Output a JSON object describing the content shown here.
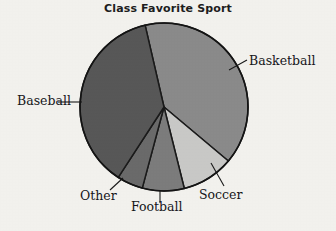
{
  "chart_data": {
    "type": "pie",
    "title": "Class Favorite Sport",
    "subtitle": "",
    "xlabel": "",
    "ylabel": "",
    "legend_position": "none",
    "labels_position": "outside-with-leader-lines",
    "grid": false,
    "categories": [
      "Basketball",
      "Soccer",
      "Football",
      "Other",
      "Baseball"
    ],
    "values": [
      39.7,
      10.0,
      8.1,
      5.0,
      37.2
    ],
    "units": "percent",
    "slices": [
      {
        "name": "Basketball",
        "label": "Basketball",
        "value": 39.7,
        "color": "#8b8b8b",
        "start_angle_deg": 347,
        "end_angle_deg": 130,
        "leader_from": [
          229,
          70
        ],
        "leader_to": [
          247,
          60
        ],
        "label_anchor": "start"
      },
      {
        "name": "Soccer",
        "label": "Soccer",
        "value": 10.0,
        "color": "#cacac8",
        "start_angle_deg": 130,
        "end_angle_deg": 166,
        "leader_from": [
          211,
          163
        ],
        "leader_to": [
          224,
          186
        ],
        "label_anchor": "middle"
      },
      {
        "name": "Football",
        "label": "Football",
        "value": 8.1,
        "color": "#7d7d7d",
        "start_angle_deg": 166,
        "end_angle_deg": 195,
        "leader_from": [
          160,
          190
        ],
        "leader_to": [
          160,
          203
        ],
        "label_anchor": "middle"
      },
      {
        "name": "Other",
        "label": "Other",
        "value": 5.0,
        "color": "#6b6b6b",
        "start_angle_deg": 195,
        "end_angle_deg": 213,
        "leader_from": [
          123,
          178
        ],
        "leader_to": [
          110,
          190
        ],
        "label_anchor": "end"
      },
      {
        "name": "Baseball",
        "label": "Baseball",
        "value": 37.2,
        "color": "#585858",
        "start_angle_deg": 213,
        "end_angle_deg": 347,
        "leader_from": [
          82,
          102
        ],
        "leader_to": [
          58,
          102
        ],
        "label_anchor": "end"
      }
    ],
    "geometry": {
      "center_x": 164,
      "center_y": 107,
      "radius": 84
    },
    "colors": {
      "background": "#f4f3ef",
      "outline": "#1a1a1a",
      "text": "#16161a",
      "title": "#1d1d1d"
    }
  }
}
